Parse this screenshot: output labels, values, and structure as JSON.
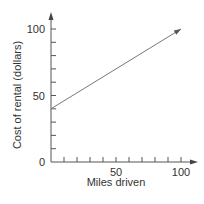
{
  "chart_data": {
    "type": "line",
    "title": "",
    "xlabel": "Miles driven",
    "ylabel": "Cost of rental  (dollars)",
    "xlim": [
      0,
      110
    ],
    "ylim": [
      0,
      110
    ],
    "x_ticks": [
      0,
      10,
      20,
      30,
      40,
      50,
      60,
      70,
      80,
      90,
      100
    ],
    "x_tick_labels": [
      "50",
      "100"
    ],
    "y_ticks": [
      0,
      10,
      20,
      30,
      40,
      50,
      60,
      70,
      80,
      90,
      100
    ],
    "y_tick_labels": [
      "0",
      "50",
      "100"
    ],
    "grid": false,
    "legend": null,
    "series": [
      {
        "name": "Cost of rental",
        "x": [
          0,
          100
        ],
        "y": [
          40,
          100
        ],
        "equation": "y = 40 + 0.6x",
        "arrow_end": true
      }
    ],
    "colors": {
      "axis": "#555555",
      "line": "#777777",
      "text": "#333333"
    }
  }
}
